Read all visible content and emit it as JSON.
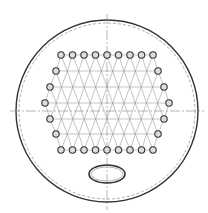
{
  "drawing": {
    "title": "Tube sheet layout",
    "shell": {
      "cx": 107,
      "cy": 111,
      "r": 91,
      "inner_dashed_r": 88
    },
    "centerlines": {
      "h": {
        "x1": 10,
        "x2": 204,
        "y": 111
      },
      "v": {
        "x": 107,
        "y1": 14,
        "y2": 210
      }
    },
    "tube_radius": 3.2,
    "rows": [
      {
        "y": 55,
        "x_start": 61,
        "count": 9,
        "pitch": 11.5
      },
      {
        "y": 71,
        "x_start": 56,
        "count": 10,
        "pitch": 11.5
      },
      {
        "y": 87,
        "x_start": 50,
        "count": 11,
        "pitch": 11.5
      },
      {
        "y": 103,
        "x_start": 45,
        "count": 12,
        "pitch": 11.3
      },
      {
        "y": 119,
        "x_start": 50,
        "count": 11,
        "pitch": 11.5
      },
      {
        "y": 134,
        "x_start": 56,
        "count": 10,
        "pitch": 11.5
      },
      {
        "y": 150,
        "x_start": 61,
        "count": 9,
        "pitch": 11.5
      }
    ],
    "manway": {
      "cx": 107,
      "cy": 174,
      "rx": 18,
      "ry": 9
    },
    "colors": {
      "line": "#333333",
      "light": "#888888",
      "tube_fill": "#dddddd"
    }
  }
}
